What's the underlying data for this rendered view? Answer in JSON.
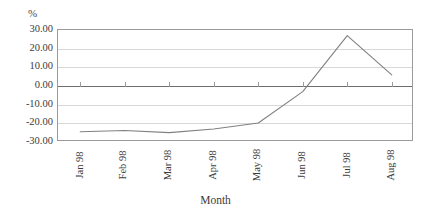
{
  "chart_data": {
    "type": "line",
    "title": "",
    "xlabel": "Month",
    "ylabel": "%",
    "categories": [
      "Jan 98",
      "Feb 98",
      "Mar 98",
      "Apr 98",
      "May 98",
      "Jun 98",
      "Jul 98",
      "Aug 98"
    ],
    "series": [
      {
        "name": "series-1",
        "color": "#808080",
        "values": [
          -24.5,
          -23.8,
          -25.0,
          -23.0,
          -19.8,
          -3.0,
          27.0,
          6.0
        ]
      }
    ],
    "ylim": [
      -30.0,
      30.0
    ],
    "ytick_labels": [
      "30.00",
      "20.00",
      "10.00",
      "0.00",
      "-10.00",
      "-20.00",
      "-30.00"
    ],
    "ytick_values": [
      30.0,
      20.0,
      10.0,
      0.0,
      -10.0,
      -20.0,
      -30.0
    ],
    "grid": true,
    "legend": "none",
    "zero_line": true,
    "markers": false,
    "frame_color": "#9b9b9b",
    "grid_color": "#d8d8d8",
    "zero_line_color": "#6e6e6e"
  },
  "axes": {
    "y_unit_label": "%",
    "x_axis_title": "Month"
  }
}
